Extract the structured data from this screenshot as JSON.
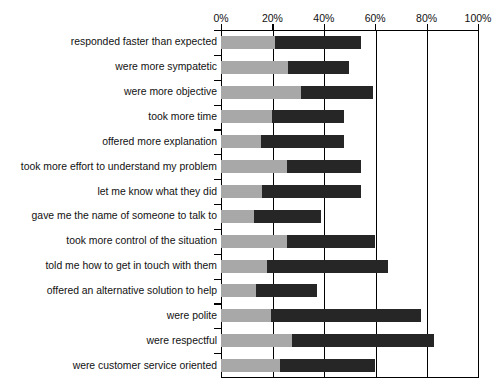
{
  "chart_data": {
    "type": "bar",
    "subtype": "stacked-horizontal",
    "title": "",
    "xlabel": "",
    "ylabel": "",
    "xlim": [
      0,
      100
    ],
    "xticks": [
      0,
      20,
      40,
      60,
      80,
      100
    ],
    "xtick_labels": [
      "0%",
      "20%",
      "40%",
      "60%",
      "80%",
      "100%"
    ],
    "grid": true,
    "grid_axis": "x",
    "legend": false,
    "colors": {
      "segment_1": "#a8a8a8",
      "segment_2": "#262626",
      "axis": "#000000",
      "background": "#ffffff",
      "text": "#111111"
    },
    "series": [
      {
        "name": "segment 1",
        "color": "#a8a8a8",
        "values": [
          21,
          26,
          31,
          20,
          15.5,
          25.5,
          16,
          13,
          25.5,
          18,
          13.5,
          19.5,
          27.5,
          23
        ]
      },
      {
        "name": "segment 2",
        "color": "#262626",
        "values": [
          33.5,
          24,
          28,
          28,
          32.5,
          29,
          38.5,
          26,
          34.5,
          47,
          24,
          58.5,
          55.5,
          37
        ]
      }
    ],
    "categories": [
      "responded faster than expected",
      "were more sympatetic",
      "were more objective",
      "took more time",
      "offered more explanation",
      "took more effort to understand my problem",
      "let me know what they did",
      "gave me the name of someone to talk to",
      "took more control of the situation",
      "told me how to get in touch with them",
      "offered an alternative solution to help",
      "were polite",
      "were respectful",
      "were customer service oriented"
    ],
    "totals": [
      54.5,
      50,
      59,
      48,
      48,
      54.5,
      54.5,
      39,
      60,
      65,
      37.5,
      78,
      83,
      60
    ]
  },
  "axis": {
    "tick_labels": [
      "0%",
      "20%",
      "40%",
      "60%",
      "80%",
      "100%"
    ]
  },
  "ghost_title": ""
}
